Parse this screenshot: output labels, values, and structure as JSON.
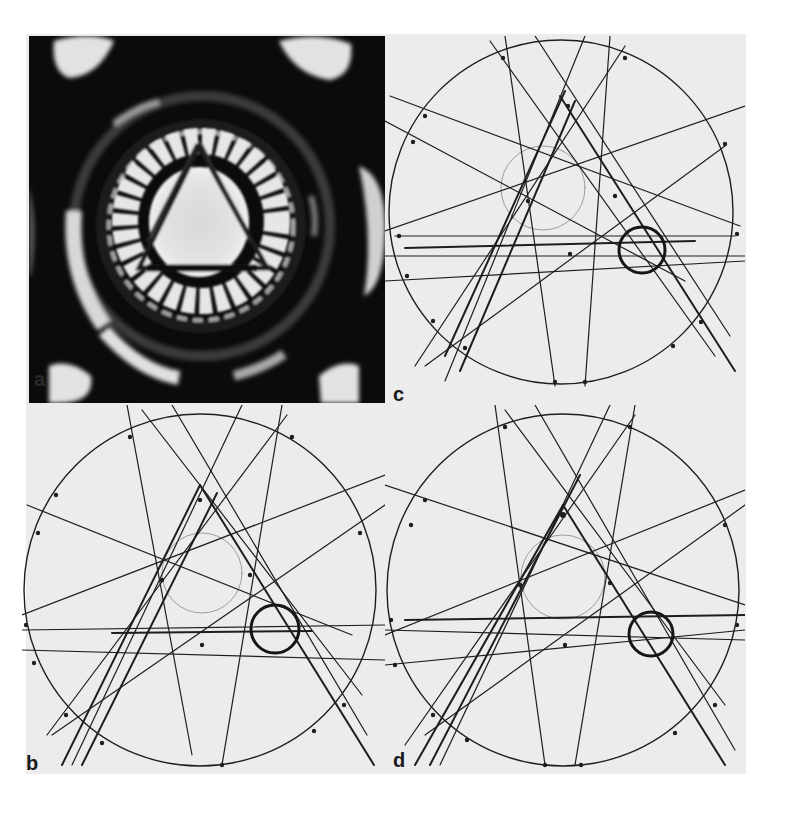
{
  "figure": {
    "panels": [
      {
        "id": "a",
        "label": "a",
        "type": "diffraction-pattern",
        "description": "Experimental convergent-beam electron diffraction pattern with 3-fold symmetry"
      },
      {
        "id": "b",
        "label": "b",
        "type": "line-diagram",
        "description": "Simulated Kikuchi/HOLZ line pattern"
      },
      {
        "id": "c",
        "label": "c",
        "type": "line-diagram",
        "description": "Simulated Kikuchi/HOLZ line pattern"
      },
      {
        "id": "d",
        "label": "d",
        "type": "line-diagram",
        "description": "Simulated Kikuchi/HOLZ line pattern"
      }
    ]
  },
  "colors": {
    "page_bg": "#ffffff",
    "panel_bg": "#ececec",
    "line": "#1e1e1e",
    "dark_bg": "#0c0c0c",
    "bright": "#e8e8e8"
  }
}
